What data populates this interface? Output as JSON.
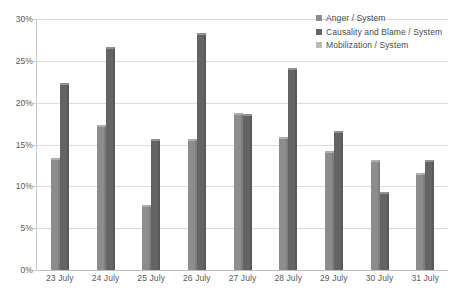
{
  "chart_data": {
    "type": "bar",
    "title": "",
    "subtitle": "",
    "xlabel": "",
    "ylabel": "",
    "ylim": [
      0,
      30
    ],
    "ytick_step": 5,
    "ytick_labels": [
      "0%",
      "5%",
      "10%",
      "15%",
      "20%",
      "25%",
      "30%"
    ],
    "grid": true,
    "legend_position": "top-right",
    "value_suffix": "%",
    "categories": [
      "23 July",
      "24 July",
      "25 July",
      "26 July",
      "27 July",
      "28 July",
      "29 July",
      "30 July",
      "31 July"
    ],
    "series": [
      {
        "name": "Anger / System",
        "color": "#8d8d8d",
        "values": [
          13.4,
          17.3,
          7.8,
          15.7,
          18.8,
          15.9,
          14.2,
          13.1,
          11.6
        ]
      },
      {
        "name": "Causality and Blame / System",
        "color": "#646464",
        "values": [
          22.3,
          26.7,
          15.7,
          28.3,
          18.6,
          24.1,
          16.6,
          9.3,
          13.1
        ]
      },
      {
        "name": "Mobilization / System",
        "color": "#b9b9b9",
        "values": [
          0,
          0,
          0,
          0,
          0,
          0,
          0,
          0,
          0
        ]
      }
    ]
  },
  "legend": {
    "items": [
      {
        "label": "Anger / System",
        "swatch": "legend-swatch-anger"
      },
      {
        "label": "Causality and Blame / System",
        "swatch": "legend-swatch-causality"
      },
      {
        "label": "Mobilization / System",
        "swatch": "legend-swatch-mobilization"
      }
    ]
  },
  "axes": {
    "y_ticks": [
      "30%",
      "25%",
      "20%",
      "15%",
      "10%",
      "5%",
      "0%"
    ],
    "x_ticks": [
      "23 July",
      "24 July",
      "25 July",
      "26 July",
      "27 July",
      "28 July",
      "29 July",
      "30 July",
      "31 July"
    ]
  }
}
